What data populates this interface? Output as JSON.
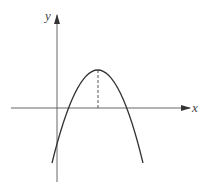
{
  "diagram": {
    "type": "function-graph",
    "axes": {
      "x_label": "x",
      "y_label": "y"
    },
    "colors": {
      "curve": "#333333",
      "axis": "#555555",
      "dashed": "#555555"
    }
  }
}
